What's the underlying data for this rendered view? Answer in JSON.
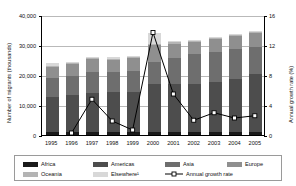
{
  "chart_data": {
    "type": "bar",
    "variant": "stacked-bar-with-line-overlay",
    "title": "",
    "xlabel": "",
    "ylabel": "Number of migrants (thousands)",
    "y2label": "Annual growth rate (%)",
    "ylim": [
      0,
      40000
    ],
    "y2lim": [
      0,
      16
    ],
    "yticks": [
      "0",
      "10,000",
      "20,000",
      "30,000",
      "40,000"
    ],
    "ytick_values": [
      0,
      10000,
      20000,
      30000,
      40000
    ],
    "y2ticks": [
      "0",
      "4",
      "8",
      "12",
      "16"
    ],
    "y2tick_values": [
      0,
      4,
      8,
      12,
      16
    ],
    "grid": true,
    "legend_position": "bottom",
    "categories": [
      "1995",
      "1996",
      "1997",
      "1998",
      "1999",
      "2000",
      "2001",
      "2002",
      "2003",
      "2004",
      "2005"
    ],
    "series": [
      {
        "name": "Africa",
        "color": "#1a1a1a",
        "values": [
          900,
          900,
          900,
          900,
          900,
          1000,
          1000,
          1000,
          1000,
          1000,
          1000
        ]
      },
      {
        "name": "Americas",
        "color": "#4d4d4d",
        "values": [
          11800,
          12500,
          13000,
          13400,
          13500,
          16000,
          15900,
          16000,
          16700,
          17800,
          19400
        ]
      },
      {
        "name": "Asia",
        "color": "#6e6e6e",
        "values": [
          6200,
          6300,
          7100,
          6600,
          6800,
          7500,
          8800,
          9900,
          9900,
          9800,
          9000
        ]
      },
      {
        "name": "Europe",
        "color": "#8f8f8f",
        "values": [
          3700,
          4000,
          4400,
          4100,
          4500,
          5500,
          4800,
          4200,
          4400,
          4500,
          4700
        ]
      },
      {
        "name": "Oceania",
        "color": "#b4b4b4",
        "values": [
          300,
          300,
          300,
          300,
          300,
          400,
          400,
          400,
          400,
          400,
          400
        ]
      },
      {
        "name": "Elsewhere¹",
        "color": "#d8d8d8",
        "values": [
          1200,
          200,
          200,
          700,
          200,
          3600,
          400,
          300,
          200,
          300,
          300
        ]
      }
    ],
    "totals": [
      24100,
      24200,
      25900,
      26000,
      26200,
      34000,
      31300,
      31800,
      32600,
      33800,
      34800
    ],
    "line_series": {
      "name": "Annual growth rate",
      "color": "#000000",
      "marker": "open-square",
      "axis": "secondary",
      "values": [
        null,
        0.4,
        4.9,
        2.0,
        0.8,
        13.8,
        5.6,
        2.1,
        3.1,
        2.4,
        2.7
      ]
    },
    "legend": [
      {
        "label": "Africa",
        "type": "swatch",
        "color": "#1a1a1a"
      },
      {
        "label": "Americas",
        "type": "swatch",
        "color": "#4d4d4d"
      },
      {
        "label": "Asia",
        "type": "swatch",
        "color": "#6e6e6e"
      },
      {
        "label": "Europe",
        "type": "swatch",
        "color": "#8f8f8f"
      },
      {
        "label": "Oceania",
        "type": "swatch",
        "color": "#b4b4b4"
      },
      {
        "label": "Elsewhere¹",
        "type": "swatch",
        "color": "#d8d8d8"
      },
      {
        "label": "Annual growth rate",
        "type": "line",
        "color": "#000000"
      }
    ]
  }
}
